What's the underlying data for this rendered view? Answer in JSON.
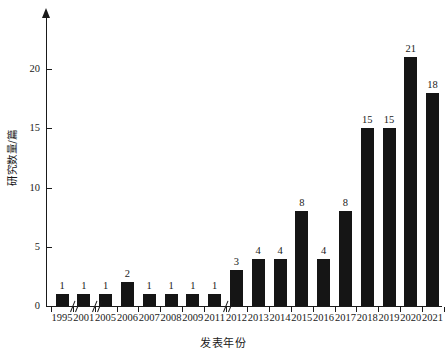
{
  "chart_data": {
    "type": "bar",
    "title": "",
    "xlabel": "发表年份",
    "ylabel": "研究数量/篇",
    "categories": [
      "1995",
      "2001",
      "2005",
      "2006",
      "2007",
      "2008",
      "2009",
      "2011",
      "2012",
      "2013",
      "2014",
      "2015",
      "2016",
      "2017",
      "2018",
      "2019",
      "2020",
      "2021"
    ],
    "values": [
      1,
      1,
      1,
      2,
      1,
      1,
      1,
      1,
      3,
      4,
      4,
      8,
      4,
      8,
      15,
      15,
      21,
      18
    ],
    "ylim": [
      0,
      22
    ],
    "yticks": [
      0,
      5,
      10,
      15,
      20
    ],
    "ytick_labels": [
      "0",
      "5",
      "10",
      "15",
      "20"
    ],
    "grid": false,
    "legend": null,
    "bar_color": "#151515",
    "axis_color": "#1a1a1a",
    "show_value_labels": true,
    "axis_breaks": [
      {
        "after_category": "1995",
        "symbol": "//"
      },
      {
        "after_category": "2001",
        "symbol": "//"
      },
      {
        "after_category": "2011",
        "symbol": "//"
      }
    ]
  }
}
